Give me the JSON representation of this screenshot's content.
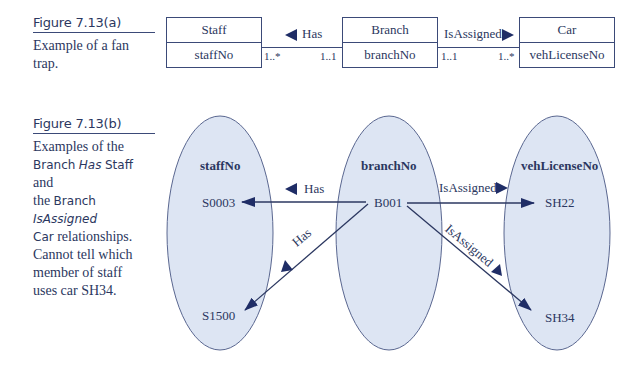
{
  "figure_a": {
    "label": "Figure 7.13(a)",
    "caption": "Example of a fan trap.",
    "entities": [
      {
        "name": "Staff",
        "attribute": "staffNo"
      },
      {
        "name": "Branch",
        "attribute": "branchNo"
      },
      {
        "name": "Car",
        "attribute": "vehLicenseNo"
      }
    ],
    "relationships": [
      {
        "label": "Has",
        "direction": "left",
        "left_mult": "1..*",
        "right_mult": "1..1"
      },
      {
        "label": "IsAssigned",
        "direction": "right",
        "left_mult": "1..1",
        "right_mult": "1..*"
      }
    ]
  },
  "figure_b": {
    "label": "Figure 7.13(b)",
    "caption_parts": {
      "p1": "Examples of the",
      "branch1": "Branch",
      "has": "Has",
      "staff": "Staff",
      "and": "and",
      "the": "the",
      "branch2": "Branch",
      "isassigned": "IsAssigned",
      "car": "Car",
      "p2": "relationships.",
      "p3": "Cannot tell which",
      "p4": "member of staff",
      "p5": "uses car SH34."
    },
    "sets": [
      {
        "title": "staffNo",
        "members": [
          "S0003",
          "S1500"
        ]
      },
      {
        "title": "branchNo",
        "members": [
          "B001"
        ]
      },
      {
        "title": "vehLicenseNo",
        "members": [
          "SH22",
          "SH34"
        ]
      }
    ],
    "links": [
      {
        "label": "Has",
        "from": "B001",
        "to": "S0003"
      },
      {
        "label": "Has",
        "from": "B001",
        "to": "S1500"
      },
      {
        "label": "IsAssigned",
        "from": "B001",
        "to": "SH22"
      },
      {
        "label": "IsAssigned",
        "from": "B001",
        "to": "SH34"
      }
    ]
  },
  "colors": {
    "ink": "#2b3760",
    "line": "#3b4a78",
    "arrow": "#1f2d66",
    "ellipse_fill": "#dde5f3"
  }
}
